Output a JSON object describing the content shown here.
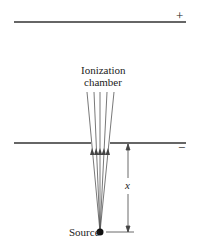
{
  "diagram": {
    "top_plate_sign": "+",
    "bottom_plate_sign": "−",
    "chamber_label_line1": "Ionization",
    "chamber_label_line2": "chamber",
    "distance_label": "x",
    "source_label": "Source",
    "ray_count": 5
  }
}
